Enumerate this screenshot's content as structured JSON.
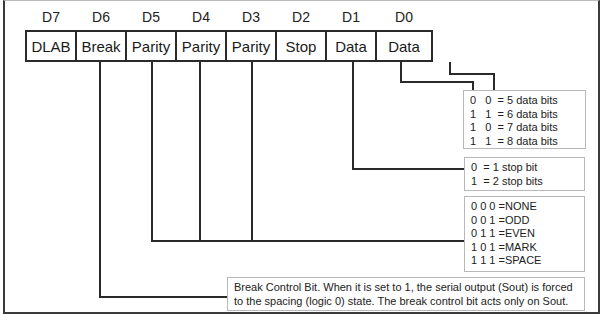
{
  "diagram": {
    "bits": [
      {
        "index": "D7",
        "name": "DLAB"
      },
      {
        "index": "D6",
        "name": "Break"
      },
      {
        "index": "D5",
        "name": "Parity"
      },
      {
        "index": "D4",
        "name": "Parity"
      },
      {
        "index": "D3",
        "name": "Parity"
      },
      {
        "index": "D2",
        "name": "Stop"
      },
      {
        "index": "D1",
        "name": "Data"
      },
      {
        "index": "D0",
        "name": "Data"
      }
    ],
    "data_bits_table": [
      "0   0  = 5 data bits",
      "1   1  = 6 data bits",
      "1   0  = 7 data bits",
      "1   1  = 8 data bits"
    ],
    "stop_bits_table": [
      "0  = 1 stop bit",
      "1  = 2 stop bits"
    ],
    "parity_table": [
      "0 0 0 =NONE",
      "0 0 1 =ODD",
      "0 1 1 =EVEN",
      "1 0 1 =MARK",
      "1 1 1 =SPACE"
    ],
    "break_note": [
      "Break Control Bit. When it is set to 1, the serial output (Sout) is forced",
      "to the spacing (logic 0) state. The break control bit acts only on Sout."
    ]
  }
}
